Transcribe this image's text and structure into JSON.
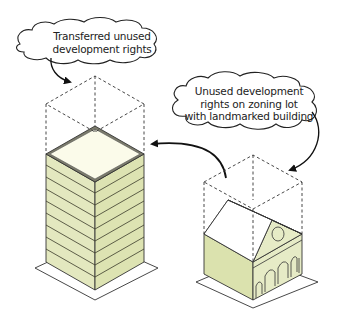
{
  "diagram": {
    "type": "illustration",
    "callouts": [
      {
        "id": "transferred",
        "lines": [
          "Transferred unused",
          "development rights"
        ]
      },
      {
        "id": "unused",
        "lines": [
          "Unused development",
          "rights on zoning lot",
          "with landmarked building"
        ]
      }
    ],
    "colors": {
      "building_fill": "#e3e8bf",
      "building_fill_dark": "#d4dba6",
      "roof_fill": "#fbfbea",
      "outline": "#333333",
      "dashed": "#333333",
      "background": "#ffffff"
    }
  }
}
